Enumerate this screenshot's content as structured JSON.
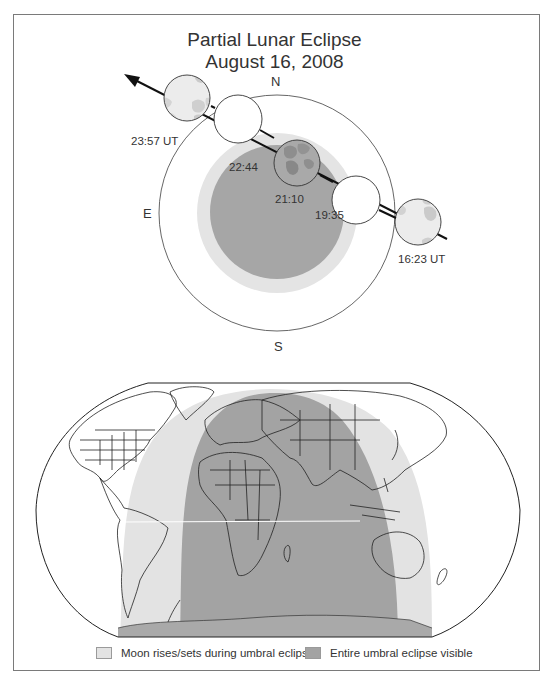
{
  "title": {
    "line1": "Partial Lunar Eclipse",
    "line2": "August 16, 2008"
  },
  "diagram": {
    "directions": {
      "north": "N",
      "south": "S",
      "east": "E"
    },
    "moon_positions": [
      {
        "time": "16:23 UT",
        "phase": "penumbral contact begin"
      },
      {
        "time": "19:35",
        "phase": "umbral contact begin"
      },
      {
        "time": "21:10",
        "phase": "greatest eclipse"
      },
      {
        "time": "22:44",
        "phase": "umbral contact end"
      },
      {
        "time": "23:57 UT",
        "phase": "penumbral contact end"
      }
    ],
    "path_arrow_direction": "east (upper-left)"
  },
  "map": {
    "projection": "world map (Robinson-like)",
    "zones": [
      {
        "name": "moon-rises-sets",
        "color": "#e3e3e3"
      },
      {
        "name": "entire-eclipse-visible",
        "color": "#a3a3a3"
      }
    ]
  },
  "legend": {
    "items": [
      {
        "label": "Moon rises/sets during umbral eclipse",
        "color": "#e3e3e3"
      },
      {
        "label": "Entire umbral eclipse visible",
        "color": "#a3a3a3"
      }
    ]
  },
  "colors": {
    "penumbra": "#e4e4e4",
    "umbra": "#a6a6a6",
    "frame": "#7a7a7a",
    "ink": "#333333"
  }
}
